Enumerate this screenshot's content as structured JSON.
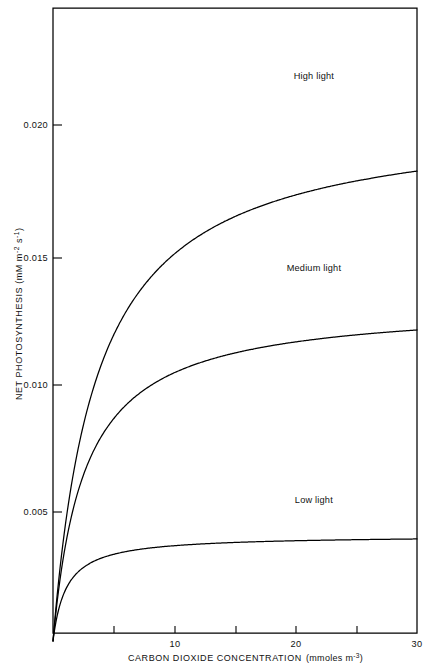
{
  "figure": {
    "name": "net-photosynthesis-vs-co2-concentration",
    "background_color": "#ffffff",
    "line_color": "#000000",
    "text_color": "#111111"
  },
  "chart_data": {
    "type": "line",
    "title": "",
    "xlabel_main": "CARBON DIOXIDE CONCENTRATION",
    "xlabel_units": "(mmoles m",
    "xlabel_units_exp": "-3",
    "xlabel_units_close": ")",
    "xlabel": "CARBON DIOXIDE CONCENTRATION (mmoles m-3)",
    "ylabel_main": "NET PHOTOSYNTHESIS (mM m",
    "ylabel_exp1": "-2",
    "ylabel_mid": " s",
    "ylabel_exp2": "-1",
    "ylabel_close": ")",
    "ylabel": "NET PHOTOSYNTHESIS (mM m-2 s-1)",
    "xlim": [
      0,
      30
    ],
    "ylim": [
      0,
      0.0246
    ],
    "grid": false,
    "legend_position": "inline-curve-labels",
    "xticks": [
      0,
      5,
      10,
      15,
      20,
      25,
      30
    ],
    "xtick_labels": [
      "",
      "",
      "10",
      "",
      "20",
      "",
      "30"
    ],
    "yticks": [
      0.005,
      0.01,
      0.015,
      0.02
    ],
    "ytick_labels": [
      "0.005",
      "0.010",
      "0.015",
      "0.020"
    ],
    "series": [
      {
        "name": "High light",
        "label": "High light",
        "plateau": 0.0204,
        "half_saturation": 3.6,
        "label_x": 21.5,
        "label_y": 0.0219,
        "x": [
          0.0,
          0.5,
          1.0,
          1.5,
          2.0,
          2.5,
          3.0,
          3.5,
          4.0,
          4.5,
          5.0,
          5.5,
          6.0,
          6.5,
          7.0,
          7.5,
          8.0,
          9.0,
          10.0,
          11.0,
          12.0,
          13.0,
          14.0,
          15.0,
          16.0,
          18.0,
          20.0,
          25.0,
          30.0
        ],
        "y": [
          0.0,
          0.00129,
          0.00283,
          0.0044,
          0.00597,
          0.00751,
          0.009,
          0.01043,
          0.01179,
          0.01307,
          0.01427,
          0.01537,
          0.01638,
          0.01729,
          0.0181,
          0.0188,
          0.01937,
          0.02016,
          0.0204,
          0.0204,
          0.0204,
          0.0204,
          0.0204,
          0.0204,
          0.0204,
          0.0204,
          0.0204,
          0.0204,
          0.0204
        ]
      },
      {
        "name": "Medium light",
        "label": "Medium light",
        "plateau": 0.0131,
        "half_saturation": 2.6,
        "label_x": 21.5,
        "label_y": 0.01445,
        "x": [
          0.0,
          0.5,
          1.0,
          1.5,
          2.0,
          2.5,
          3.0,
          3.5,
          4.0,
          4.5,
          5.0,
          5.5,
          6.0,
          6.5,
          7.0,
          7.5,
          8.0,
          9.0,
          10.0,
          11.0,
          12.0,
          13.0,
          14.0,
          16.0,
          18.0,
          20.0,
          25.0,
          30.0
        ],
        "y": [
          0.0,
          0.00127,
          0.00272,
          0.00415,
          0.00552,
          0.00681,
          0.008,
          0.00908,
          0.01004,
          0.01089,
          0.01162,
          0.01224,
          0.01275,
          0.01316,
          0.01348,
          0.01373,
          0.01391,
          0.0131,
          0.0131,
          0.0131,
          0.0131,
          0.0131,
          0.0131,
          0.0131,
          0.0131,
          0.0131,
          0.0131,
          0.0131
        ]
      },
      {
        "name": "Low light",
        "label": "Low light",
        "plateau": 0.0041,
        "half_saturation": 1.1,
        "label_x": 21.5,
        "label_y": 0.00545,
        "x": [
          0.0,
          0.25,
          0.5,
          0.75,
          1.0,
          1.5,
          2.0,
          2.5,
          3.0,
          3.5,
          4.0,
          5.0,
          6.0,
          7.0,
          8.0,
          10.0,
          12.0,
          15.0,
          20.0,
          25.0,
          30.0
        ],
        "y": [
          0.0,
          0.00095,
          0.00165,
          0.0022,
          0.00262,
          0.0032,
          0.00355,
          0.00376,
          0.0039,
          0.00398,
          0.00403,
          0.00407,
          0.00408,
          0.00409,
          0.00409,
          0.0041,
          0.0041,
          0.0041,
          0.0041,
          0.0041,
          0.0041
        ]
      }
    ]
  },
  "axes": {
    "y_tick_0": "0.005",
    "y_tick_1": "0.010",
    "y_tick_2": "0.015",
    "y_tick_3": "0.020",
    "x_tick_10": "10",
    "x_tick_20": "20",
    "x_tick_30": "30"
  },
  "labels": {
    "high_light": "High light",
    "medium_light": "Medium light",
    "low_light": "Low light"
  }
}
